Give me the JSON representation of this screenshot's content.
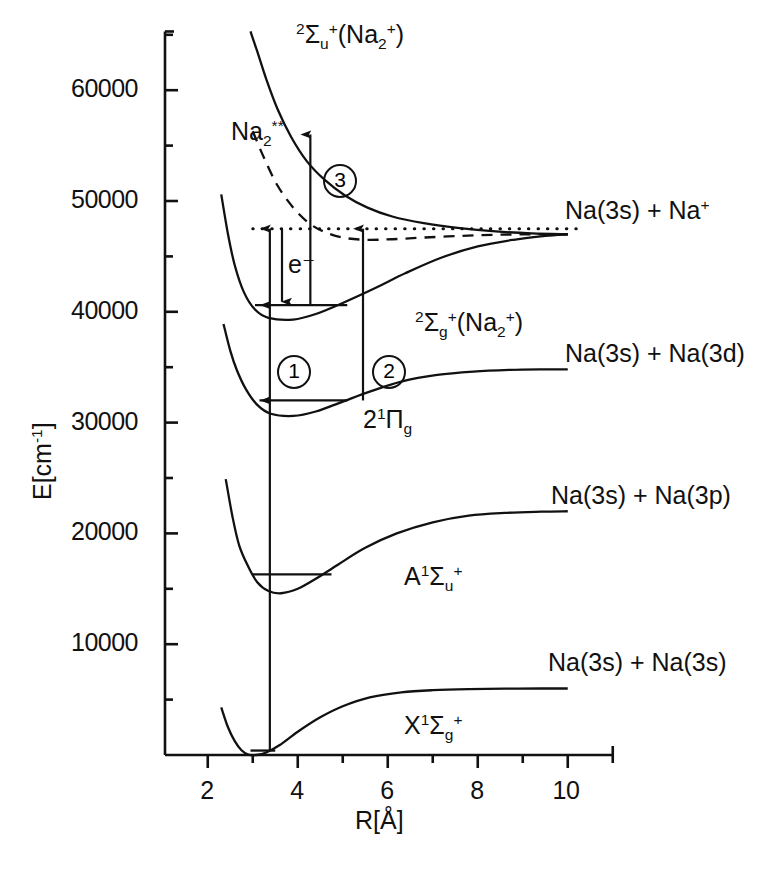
{
  "figure": {
    "domain": "chart",
    "axes": {
      "x": {
        "title": "R[Å]",
        "ticks": [
          "2",
          "4",
          "6",
          "8",
          "10"
        ],
        "tick_values": [
          2,
          4,
          6,
          8,
          10
        ],
        "minor_step": 1,
        "range": [
          1.05,
          11.0
        ]
      },
      "y": {
        "title": "E[cm⁻¹]",
        "ticks": [
          "10000",
          "20000",
          "30000",
          "40000",
          "50000",
          "60000"
        ],
        "tick_values": [
          10000,
          20000,
          30000,
          40000,
          50000,
          60000
        ],
        "minor_step": 5000,
        "range": [
          0,
          65300
        ]
      }
    },
    "states": [
      {
        "id": "X",
        "label_html": "X<sup>1</sup>Σ<sub>g</sub><sup>+</sup>",
        "asymptote_label": "Na(3s) + Na(3s)",
        "asymptote_energy": 6000,
        "r_min": 3.08,
        "e_min": 0
      },
      {
        "id": "A",
        "label_html": "A<sup>1</sup>Σ<sub>u</sub><sup>+</sup>",
        "asymptote_label": "Na(3s) + Na(3p)",
        "asymptote_energy": 22000,
        "r_min": 3.63,
        "e_min": 14600
      },
      {
        "id": "2Pig",
        "label_html": "2<sup>1</sup>Π<sub>g</sub>",
        "asymptote_label": "Na(3s) + Na(3d)",
        "asymptote_energy": 34800,
        "r_min": 3.9,
        "e_min": 30600
      },
      {
        "id": "2Sgp",
        "label_html": "<sup>2</sup>Σ<sub>g</sub><sup>+</sup>(Na<sub>2</sub><sup>+</sup>)",
        "asymptote_label": "Na(3s) + Na<sup>+</sup>",
        "asymptote_energy": 47000,
        "r_min": 3.9,
        "e_min": 39300
      },
      {
        "id": "2Sup",
        "label_html": "<sup>2</sup>Σ<sub>u</sub><sup>+</sup>(Na<sub>2</sub><sup>+</sup>)",
        "asymptote_label": "",
        "asymptote_energy": 47000,
        "r_min": null,
        "e_min": null
      },
      {
        "id": "Na2dstar",
        "label_html": "Na<sub>2</sub><sup>**</sup>",
        "asymptote_label": "",
        "asymptote_energy": 47000,
        "r_min": null,
        "e_min": null,
        "style": "dashed"
      }
    ],
    "annotations": {
      "step1": "1",
      "step2": "2",
      "step3": "3",
      "electron": "e⁻",
      "ionization_limit_energy": 47500,
      "ionization_limit_style": "dotted"
    },
    "chart_data": {
      "type": "line",
      "title": "",
      "xlabel": "R[Å]",
      "ylabel": "E[cm^-1]",
      "xlim": [
        1.05,
        11.0
      ],
      "ylim": [
        0,
        65300
      ],
      "grid": false,
      "legend": "none",
      "series": [
        {
          "name": "X 1Sigma_g+",
          "style": "solid",
          "x": [
            2.3,
            2.45,
            2.6,
            2.75,
            2.9,
            3.08,
            3.3,
            3.6,
            4.0,
            4.5,
            5.0,
            5.6,
            6.3,
            7.0,
            7.8,
            8.6,
            9.4,
            10.0
          ],
          "y": [
            4300,
            2500,
            1250,
            430,
            40,
            0,
            230,
            900,
            2100,
            3400,
            4400,
            5200,
            5650,
            5850,
            5950,
            5990,
            6000,
            6000
          ]
        },
        {
          "name": "A 1Sigma_u+",
          "style": "solid",
          "x": [
            2.4,
            2.55,
            2.7,
            2.9,
            3.1,
            3.35,
            3.63,
            4.0,
            4.4,
            4.9,
            5.5,
            6.2,
            7.0,
            7.8,
            8.6,
            9.4,
            10.0
          ],
          "y": [
            24900,
            21500,
            18900,
            17000,
            15600,
            14800,
            14600,
            15000,
            15900,
            17200,
            18700,
            20000,
            21000,
            21600,
            21850,
            21960,
            22000
          ]
        },
        {
          "name": "2 1Pi_g",
          "style": "solid",
          "x": [
            2.35,
            2.5,
            2.65,
            2.85,
            3.1,
            3.4,
            3.9,
            4.4,
            5.0,
            5.6,
            6.3,
            7.1,
            7.9,
            8.7,
            9.4,
            10.0
          ],
          "y": [
            38900,
            36500,
            34700,
            33000,
            31600,
            30800,
            30600,
            31000,
            31900,
            32800,
            33700,
            34300,
            34600,
            34750,
            34800,
            34800
          ]
        },
        {
          "name": "2 Sigma_g+ (Na2+)",
          "style": "solid",
          "x": [
            2.3,
            2.45,
            2.6,
            2.8,
            3.05,
            3.35,
            3.9,
            4.4,
            5.0,
            5.7,
            6.4,
            7.2,
            8.0,
            8.8,
            9.5,
            10.0
          ],
          "y": [
            50600,
            47000,
            44200,
            41800,
            40200,
            39450,
            39300,
            39800,
            40800,
            42100,
            43500,
            44900,
            45900,
            46500,
            46850,
            47000
          ]
        },
        {
          "name": "2 Sigma_u+ (Na2+)",
          "style": "solid",
          "x": [
            2.95,
            3.1,
            3.3,
            3.55,
            3.85,
            4.2,
            4.6,
            5.05,
            5.55,
            6.1,
            6.8,
            7.6,
            8.4,
            9.2,
            10.0
          ],
          "y": [
            65300,
            63500,
            61000,
            58300,
            55800,
            53600,
            51900,
            50500,
            49400,
            48600,
            48000,
            47550,
            47250,
            47080,
            47000
          ]
        },
        {
          "name": "Na2**",
          "style": "dashed",
          "x": [
            3.0,
            3.25,
            3.55,
            3.9,
            4.25,
            4.6,
            5.0,
            5.5,
            6.1,
            6.8,
            7.6,
            8.4,
            9.2,
            10.0
          ],
          "y": [
            56300,
            53900,
            51400,
            49400,
            48000,
            47200,
            46700,
            46500,
            46550,
            46700,
            46850,
            46950,
            47000,
            47000
          ]
        },
        {
          "name": "ionization limit",
          "style": "dotted",
          "x": [
            3.0,
            10.2
          ],
          "y": [
            47500,
            47500
          ]
        }
      ],
      "level_lines": [
        {
          "state": "X",
          "energy": 400,
          "x_from": 2.95,
          "x_to": 3.5
        },
        {
          "state": "A",
          "energy": 16300,
          "x_from": 3.0,
          "x_to": 4.75
        },
        {
          "state": "2 1Pi_g",
          "energy": 32000,
          "x_from": 3.15,
          "x_to": 5.1
        },
        {
          "state": "2 Sigma_g+",
          "energy": 40600,
          "x_from": 3.05,
          "x_to": 5.1
        }
      ],
      "transition_arrows": [
        {
          "id": "1",
          "x": 3.38,
          "from": 400,
          "to": 32000,
          "dir": "up"
        },
        {
          "id": "1b",
          "x": 3.38,
          "from": 32000,
          "to": 40600,
          "dir": "up"
        },
        {
          "id": "1c",
          "x": 3.38,
          "from": 40600,
          "to": 47500,
          "dir": "up"
        },
        {
          "id": "2",
          "x": 5.45,
          "from": 32000,
          "to": 47500,
          "dir": "up"
        },
        {
          "id": "3",
          "x": 4.28,
          "from": 40600,
          "to": 56000,
          "dir": "up"
        },
        {
          "id": "e-",
          "x": 3.65,
          "from": 47500,
          "to": 40900,
          "dir": "down"
        }
      ]
    }
  }
}
